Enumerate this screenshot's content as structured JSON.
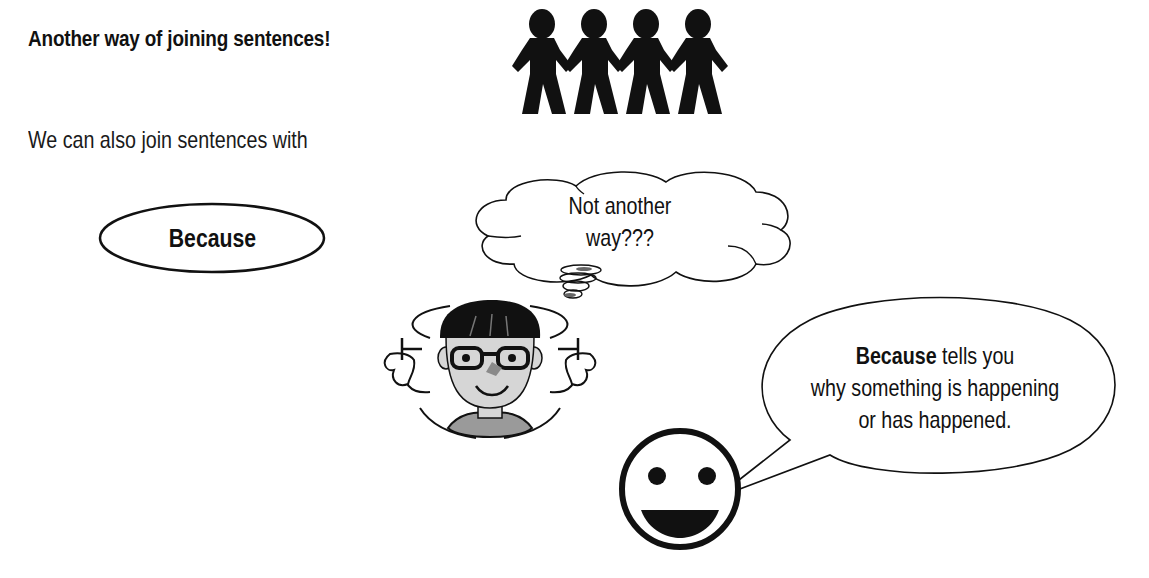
{
  "page": {
    "title": "Another way of joining sentences!",
    "intro": "We can also join sentences with"
  },
  "keyword_oval": {
    "label": "Because"
  },
  "thought_bubble": {
    "line1": "Not another",
    "line2": "way???"
  },
  "speech_bubble": {
    "bold_word": "Because",
    "line1_rest": " tells you",
    "line2": "why something is happening",
    "line3": "or has happened."
  },
  "illustrations": {
    "paper_chain": "people-holding-hands-icon",
    "confused_boy": "dizzy-boy-with-glasses-icon",
    "smiley": "smiley-face-icon"
  },
  "colors": {
    "ink": "#111111",
    "skin_grey": "#d6d6d6",
    "shirt_grey": "#9a9a9a",
    "background": "#ffffff"
  }
}
